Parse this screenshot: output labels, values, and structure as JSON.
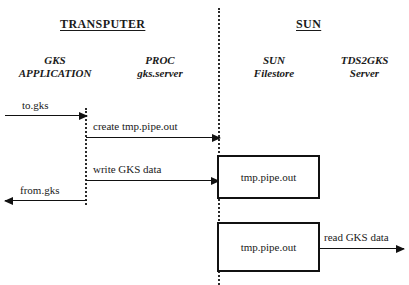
{
  "diagram": {
    "background_color": "#ffffff",
    "line_color": "#111111",
    "text_color": "#1a1a1a"
  },
  "headings": {
    "left": "TRANSPUTER",
    "right": "SUN"
  },
  "columns": [
    {
      "name": "gks-application",
      "line1": "GKS",
      "line2": "APPLICATION"
    },
    {
      "name": "proc-gks-server",
      "line1": "PROC",
      "line2": "gks.server"
    },
    {
      "name": "sun-filestore",
      "line1": "SUN",
      "line2": "Filestore"
    },
    {
      "name": "tds2gks-server",
      "line1": "TDS2GKS",
      "line2": "Server"
    }
  ],
  "messages": [
    {
      "name": "to-gks",
      "label": "to.gks",
      "direction": "right"
    },
    {
      "name": "create",
      "label": "create  tmp.pipe.out",
      "direction": "right"
    },
    {
      "name": "write",
      "label": "write GKS data",
      "direction": "right"
    },
    {
      "name": "from-gks",
      "label": "from.gks",
      "direction": "left"
    },
    {
      "name": "read",
      "label": "read GKS data",
      "direction": "right"
    }
  ],
  "file_boxes": [
    {
      "name": "upper",
      "label": "tmp.pipe.out"
    },
    {
      "name": "lower",
      "label": "tmp.pipe.out"
    }
  ]
}
